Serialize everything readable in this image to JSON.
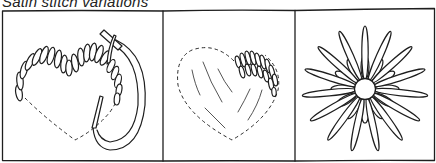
{
  "title": "Satin stitch variations",
  "panels": [
    {
      "id": "panel-1",
      "description": "Heart outline being filled with satin stitch, needle and thread looping through",
      "elements": [
        "dashed-heart-outline",
        "satin-stitch-fill",
        "needle",
        "thread-loop"
      ]
    },
    {
      "id": "panel-2",
      "description": "Dashed heart outline with guide lines and a small patch of padded satin stitch",
      "elements": [
        "dashed-heart-outline",
        "guide-lines",
        "satin-stitch-patch"
      ]
    },
    {
      "id": "panel-3",
      "description": "Flower motif of radiating satin stitch petals around a round center",
      "elements": [
        "flower-center",
        "long-petals",
        "short-petals"
      ]
    }
  ],
  "colors": {
    "ink": "#1e1e1e",
    "background": "#ffffff"
  }
}
